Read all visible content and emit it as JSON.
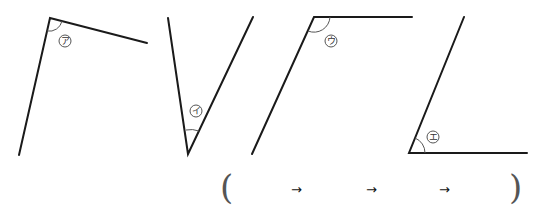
{
  "angles": [
    {
      "id": "a",
      "label": "ア"
    },
    {
      "id": "i",
      "label": "イ"
    },
    {
      "id": "u",
      "label": "ウ"
    },
    {
      "id": "e",
      "label": "エ"
    }
  ],
  "answer": {
    "open_paren": "(",
    "close_paren": ")",
    "arrows": [
      "→",
      "→",
      "→"
    ]
  }
}
